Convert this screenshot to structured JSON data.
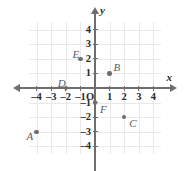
{
  "figure": {
    "kind": "coordinate-plane",
    "axis_labels": {
      "x": "x",
      "y": "y",
      "origin": "O"
    },
    "grid": {
      "visible": true,
      "color": "#e9e9e9"
    },
    "axis_color": "#6e6e6e",
    "point_color": "#6d6d6d"
  },
  "chart_data": {
    "type": "scatter",
    "title": "",
    "xlabel": "x",
    "ylabel": "y",
    "xlim": [
      -4.7,
      4.7
    ],
    "ylim": [
      -4.7,
      4.7
    ],
    "grid": true,
    "legend": "none",
    "x_ticks": [
      -4,
      -3,
      -2,
      -1,
      1,
      2,
      3,
      4
    ],
    "y_ticks": [
      -4,
      -3,
      -2,
      -1,
      1,
      2,
      3,
      4
    ],
    "x_tick_labels": [
      "-4",
      "-3",
      "-2",
      "-1",
      "1",
      "2",
      "3",
      "4"
    ],
    "y_tick_labels": [
      "-4",
      "-3",
      "-2",
      "-1",
      "1",
      "2",
      "3",
      "4"
    ],
    "origin_label": "O",
    "points": [
      {
        "label": "A",
        "x": -4,
        "y": -3,
        "label_pos": "left"
      },
      {
        "label": "B",
        "x": 1,
        "y": 1,
        "label_pos": "upper-right"
      },
      {
        "label": "C",
        "x": 2,
        "y": -2,
        "label_pos": "lower-right"
      },
      {
        "label": "D",
        "x": -2,
        "y": 0,
        "label_pos": "upper-left"
      },
      {
        "label": "E",
        "x": -1,
        "y": 2,
        "label_pos": "upper-left"
      },
      {
        "label": "F",
        "x": 0,
        "y": -1,
        "label_pos": "lower-right"
      }
    ]
  },
  "ticks": {
    "x": [
      {
        "label": "-4",
        "value": -4
      },
      {
        "label": "-3",
        "value": -3
      },
      {
        "label": "-2",
        "value": -2
      },
      {
        "label": "-1",
        "value": -1
      },
      {
        "label": "1",
        "value": 1
      },
      {
        "label": "2",
        "value": 2
      },
      {
        "label": "3",
        "value": 3
      },
      {
        "label": "4",
        "value": 4
      }
    ],
    "y": [
      {
        "label": "4",
        "value": 4
      },
      {
        "label": "3",
        "value": 3
      },
      {
        "label": "2",
        "value": 2
      },
      {
        "label": "1",
        "value": 1
      },
      {
        "label": "-1",
        "value": -1
      },
      {
        "label": "-2",
        "value": -2
      },
      {
        "label": "-3",
        "value": -3
      },
      {
        "label": "-4",
        "value": -4
      }
    ]
  }
}
